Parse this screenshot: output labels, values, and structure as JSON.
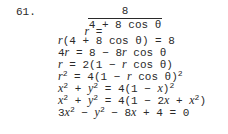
{
  "problem": {
    "number": "61.",
    "lhs_first": "r =",
    "fraction": {
      "numerator": "8",
      "denominator": "4 + 8 cos θ"
    },
    "steps": [
      "r(4 + 8 cos θ) = 8",
      "4r = 8 − 8r cos θ",
      "r = 2(1 − r cos θ)",
      "r² = 4(1 − r cos θ)²",
      "x² + y² = 4(1 − x)²",
      "x² + y² = 4(1 − 2x + x²)",
      "3x² − y² − 8x + 4 = 0"
    ]
  }
}
